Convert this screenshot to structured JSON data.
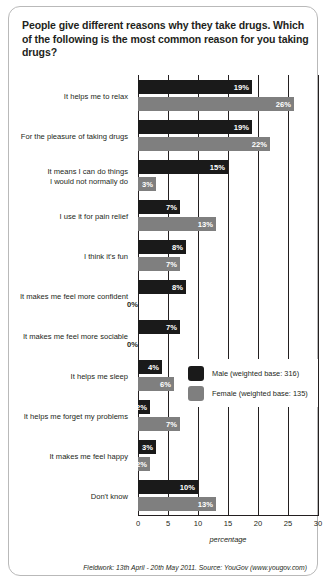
{
  "title": "People give different reasons why they take drugs. Which of the following is the most common reason for you taking drugs?",
  "axis_label": "percentage",
  "footer": "Fieldwork: 13th April - 20th May 2011. Source: YouGov (www.yougov.com)",
  "legend": {
    "male_label": "Male (weighted base: 316)",
    "female_label": "Female (weighted base: 135)"
  },
  "colors": {
    "male": "#1a1a1a",
    "female": "#7f7f7f",
    "text": "#231f20",
    "border": "#b9b9b9"
  },
  "chart_data": {
    "type": "bar",
    "orientation": "horizontal",
    "title": "People give different reasons why they take drugs. Which of the following is the most common reason for you taking drugs?",
    "xlabel": "percentage",
    "ylabel": "",
    "xlim": [
      0,
      30
    ],
    "xticks": [
      0,
      5,
      10,
      15,
      20,
      25,
      30
    ],
    "xtick_labels": [
      "0",
      "5",
      "10",
      "15",
      "20",
      "25",
      "30"
    ],
    "grid": true,
    "legend_position": "middle-right",
    "value_suffix": "%",
    "categories": [
      "It helps me to relax",
      "For the pleasure of taking drugs",
      "It means I can do things\nI would not normally do",
      "I use it for pain relief",
      "I think it's fun",
      "It makes me feel more confident",
      "It makes me feel more sociable",
      "It helps me sleep",
      "It helps me forget my problems",
      "It makes me feel happy",
      "Don't know"
    ],
    "series": [
      {
        "name": "Male (weighted base: 316)",
        "color": "#1a1a1a",
        "values": [
          19,
          19,
          15,
          7,
          8,
          8,
          7,
          4,
          2,
          3,
          10
        ],
        "value_labels": [
          "19%",
          "19%",
          "15%",
          "7%",
          "8%",
          "8%",
          "7%",
          "4%",
          "2%",
          "3%",
          "10%"
        ]
      },
      {
        "name": "Female (weighted base: 135)",
        "color": "#7f7f7f",
        "values": [
          26,
          22,
          3,
          13,
          7,
          0,
          0,
          6,
          7,
          2,
          13
        ],
        "value_labels": [
          "26%",
          "22%",
          "3%",
          "13%",
          "7%",
          "0%",
          "0%",
          "6%",
          "7%",
          "2%",
          "13%"
        ]
      }
    ]
  }
}
